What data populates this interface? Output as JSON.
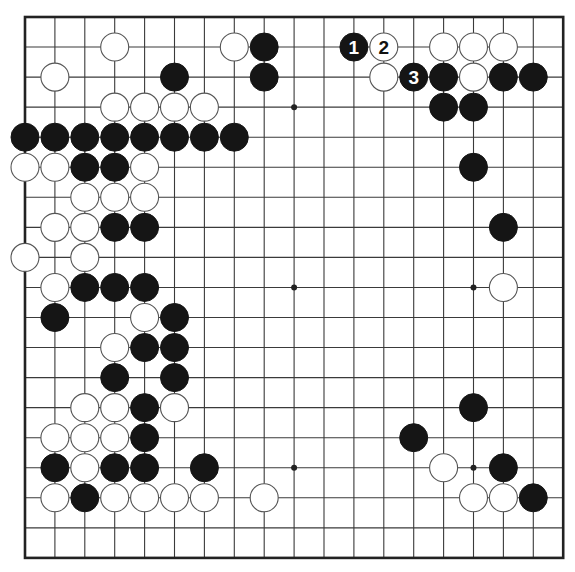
{
  "board": {
    "size": 19,
    "origin_x": 25,
    "origin_y": 17,
    "spacing_x": 29.9,
    "spacing_y": 30.05,
    "stone_radius": 14,
    "colors": {
      "line": "#3a3a3a",
      "border": "#222222",
      "black_stone": "#151515",
      "white_stone": "#ffffff",
      "white_stone_outline": "#555555",
      "background": "#ffffff"
    },
    "hoshi": [
      [
        3,
        3
      ],
      [
        9,
        3
      ],
      [
        15,
        3
      ],
      [
        3,
        9
      ],
      [
        9,
        9
      ],
      [
        15,
        9
      ],
      [
        3,
        15
      ],
      [
        9,
        15
      ],
      [
        15,
        15
      ]
    ],
    "stones": [
      {
        "c": 3,
        "r": 1,
        "color": "white"
      },
      {
        "c": 7,
        "r": 1,
        "color": "white"
      },
      {
        "c": 8,
        "r": 1,
        "color": "black"
      },
      {
        "c": 11,
        "r": 1,
        "color": "black",
        "label": "1"
      },
      {
        "c": 12,
        "r": 1,
        "color": "white",
        "label": "2"
      },
      {
        "c": 14,
        "r": 1,
        "color": "white"
      },
      {
        "c": 15,
        "r": 1,
        "color": "white"
      },
      {
        "c": 16,
        "r": 1,
        "color": "white"
      },
      {
        "c": 1,
        "r": 2,
        "color": "white"
      },
      {
        "c": 5,
        "r": 2,
        "color": "black"
      },
      {
        "c": 8,
        "r": 2,
        "color": "black"
      },
      {
        "c": 12,
        "r": 2,
        "color": "white"
      },
      {
        "c": 13,
        "r": 2,
        "color": "black",
        "label": "3"
      },
      {
        "c": 14,
        "r": 2,
        "color": "black"
      },
      {
        "c": 15,
        "r": 2,
        "color": "white"
      },
      {
        "c": 16,
        "r": 2,
        "color": "black"
      },
      {
        "c": 17,
        "r": 2,
        "color": "black"
      },
      {
        "c": 3,
        "r": 3,
        "color": "white"
      },
      {
        "c": 4,
        "r": 3,
        "color": "white"
      },
      {
        "c": 5,
        "r": 3,
        "color": "white"
      },
      {
        "c": 6,
        "r": 3,
        "color": "white"
      },
      {
        "c": 14,
        "r": 3,
        "color": "black"
      },
      {
        "c": 15,
        "r": 3,
        "color": "black"
      },
      {
        "c": 0,
        "r": 4,
        "color": "black"
      },
      {
        "c": 1,
        "r": 4,
        "color": "black"
      },
      {
        "c": 2,
        "r": 4,
        "color": "black"
      },
      {
        "c": 3,
        "r": 4,
        "color": "black"
      },
      {
        "c": 4,
        "r": 4,
        "color": "black"
      },
      {
        "c": 5,
        "r": 4,
        "color": "black"
      },
      {
        "c": 6,
        "r": 4,
        "color": "black"
      },
      {
        "c": 7,
        "r": 4,
        "color": "black"
      },
      {
        "c": 0,
        "r": 5,
        "color": "white"
      },
      {
        "c": 1,
        "r": 5,
        "color": "white"
      },
      {
        "c": 2,
        "r": 5,
        "color": "black"
      },
      {
        "c": 3,
        "r": 5,
        "color": "black"
      },
      {
        "c": 4,
        "r": 5,
        "color": "white"
      },
      {
        "c": 15,
        "r": 5,
        "color": "black"
      },
      {
        "c": 2,
        "r": 6,
        "color": "white"
      },
      {
        "c": 3,
        "r": 6,
        "color": "white"
      },
      {
        "c": 4,
        "r": 6,
        "color": "white"
      },
      {
        "c": 1,
        "r": 7,
        "color": "white"
      },
      {
        "c": 2,
        "r": 7,
        "color": "white"
      },
      {
        "c": 3,
        "r": 7,
        "color": "black"
      },
      {
        "c": 4,
        "r": 7,
        "color": "black"
      },
      {
        "c": 16,
        "r": 7,
        "color": "black"
      },
      {
        "c": 0,
        "r": 8,
        "color": "white"
      },
      {
        "c": 2,
        "r": 8,
        "color": "white"
      },
      {
        "c": 1,
        "r": 9,
        "color": "white"
      },
      {
        "c": 2,
        "r": 9,
        "color": "black"
      },
      {
        "c": 3,
        "r": 9,
        "color": "black"
      },
      {
        "c": 4,
        "r": 9,
        "color": "black"
      },
      {
        "c": 16,
        "r": 9,
        "color": "white"
      },
      {
        "c": 1,
        "r": 10,
        "color": "black"
      },
      {
        "c": 4,
        "r": 10,
        "color": "white"
      },
      {
        "c": 5,
        "r": 10,
        "color": "black"
      },
      {
        "c": 3,
        "r": 11,
        "color": "white"
      },
      {
        "c": 4,
        "r": 11,
        "color": "black"
      },
      {
        "c": 5,
        "r": 11,
        "color": "black"
      },
      {
        "c": 3,
        "r": 12,
        "color": "black"
      },
      {
        "c": 5,
        "r": 12,
        "color": "black"
      },
      {
        "c": 2,
        "r": 13,
        "color": "white"
      },
      {
        "c": 3,
        "r": 13,
        "color": "white"
      },
      {
        "c": 4,
        "r": 13,
        "color": "black"
      },
      {
        "c": 5,
        "r": 13,
        "color": "white"
      },
      {
        "c": 15,
        "r": 13,
        "color": "black"
      },
      {
        "c": 1,
        "r": 14,
        "color": "white"
      },
      {
        "c": 2,
        "r": 14,
        "color": "white"
      },
      {
        "c": 3,
        "r": 14,
        "color": "white"
      },
      {
        "c": 4,
        "r": 14,
        "color": "black"
      },
      {
        "c": 13,
        "r": 14,
        "color": "black"
      },
      {
        "c": 1,
        "r": 15,
        "color": "black"
      },
      {
        "c": 2,
        "r": 15,
        "color": "white"
      },
      {
        "c": 3,
        "r": 15,
        "color": "black"
      },
      {
        "c": 4,
        "r": 15,
        "color": "black"
      },
      {
        "c": 6,
        "r": 15,
        "color": "black"
      },
      {
        "c": 14,
        "r": 15,
        "color": "white"
      },
      {
        "c": 16,
        "r": 15,
        "color": "black"
      },
      {
        "c": 1,
        "r": 16,
        "color": "white"
      },
      {
        "c": 2,
        "r": 16,
        "color": "black"
      },
      {
        "c": 3,
        "r": 16,
        "color": "white"
      },
      {
        "c": 4,
        "r": 16,
        "color": "white"
      },
      {
        "c": 5,
        "r": 16,
        "color": "white"
      },
      {
        "c": 6,
        "r": 16,
        "color": "white"
      },
      {
        "c": 8,
        "r": 16,
        "color": "white"
      },
      {
        "c": 15,
        "r": 16,
        "color": "white"
      },
      {
        "c": 16,
        "r": 16,
        "color": "white"
      },
      {
        "c": 17,
        "r": 16,
        "color": "black"
      }
    ],
    "move_sequence": [
      {
        "number": "1",
        "color": "black",
        "c": 11,
        "r": 1
      },
      {
        "number": "2",
        "color": "white",
        "c": 12,
        "r": 1
      },
      {
        "number": "3",
        "color": "black",
        "c": 13,
        "r": 2
      }
    ]
  }
}
